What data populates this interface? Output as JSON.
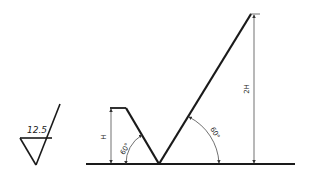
{
  "diagram": {
    "type": "surface-roughness-symbol-construction",
    "roughness_symbol": {
      "value": "12.5"
    },
    "dimensions": {
      "small_height_label": "H",
      "large_height_label": "2H",
      "small_angle_label": "60°",
      "large_angle_label": "60°"
    },
    "colors": {
      "line": "#1a1a1a",
      "thin_line": "#333333",
      "background": "#ffffff"
    }
  }
}
